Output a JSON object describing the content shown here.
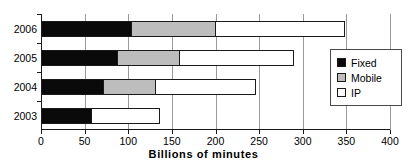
{
  "chart_data": {
    "type": "bar",
    "orientation": "horizontal",
    "stacked": true,
    "title": "",
    "xlabel": "Billions of minutes",
    "ylabel": "",
    "categories": [
      "2006",
      "2005",
      "2004",
      "2003"
    ],
    "series": [
      {
        "name": "Fixed",
        "color": "#000000",
        "values": [
          104,
          88,
          72,
          58
        ]
      },
      {
        "name": "Mobile",
        "color": "#bdbdbd",
        "values": [
          98,
          72,
          61,
          0
        ]
      },
      {
        "name": "IP",
        "color": "#ffffff",
        "values": [
          149,
          132,
          116,
          80
        ]
      }
    ],
    "totals": [
      351,
      292,
      249,
      138
    ],
    "xlim": [
      0,
      400
    ],
    "xticks": [
      0,
      50,
      100,
      150,
      200,
      250,
      300,
      350,
      400
    ],
    "xtick_labels": [
      "0",
      "50",
      "100",
      "150",
      "200",
      "250",
      "300",
      "350",
      "400"
    ],
    "grid": "vertical",
    "legend_position": "right-middle",
    "legend_entries": [
      "Fixed",
      "Mobile",
      "IP"
    ]
  },
  "legend": {
    "items": [
      {
        "label": "Fixed",
        "swatch": "black-swatch-icon"
      },
      {
        "label": "Mobile",
        "swatch": "gray-swatch-icon"
      },
      {
        "label": "IP",
        "swatch": "white-swatch-icon"
      }
    ]
  },
  "axis": {
    "x_title": "Billions of minutes"
  }
}
